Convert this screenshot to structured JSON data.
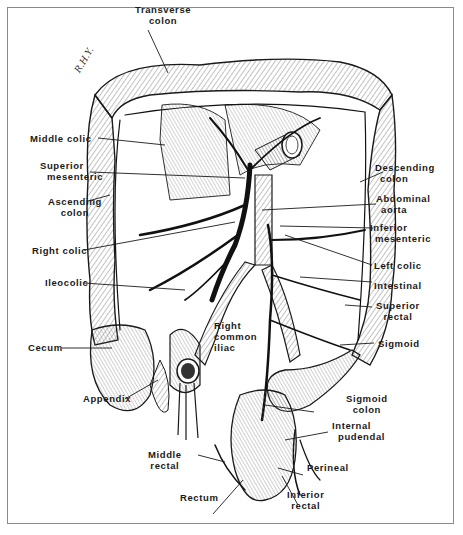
{
  "figure": {
    "signature": "R.H.Y."
  },
  "labels": {
    "transverse_colon": [
      "Transverse",
      "colon"
    ],
    "middle_colic": [
      "Middle colic"
    ],
    "superior_mesenteric": [
      "Superior",
      "mesenteric"
    ],
    "ascending_colon": [
      "Ascending",
      "colon"
    ],
    "right_colic": [
      "Right colic"
    ],
    "ileocolic": [
      "Ileocolic"
    ],
    "cecum": [
      "Cecum"
    ],
    "appendix": [
      "Appendix"
    ],
    "right_common_iliac": [
      "Right",
      "common",
      "iliac"
    ],
    "middle_rectal": [
      "Middle",
      "rectal"
    ],
    "rectum": [
      "Rectum"
    ],
    "inferior_rectal": [
      "Inferior",
      "rectal"
    ],
    "perineal": [
      "Perineal"
    ],
    "internal_pudendal": [
      "Internal",
      "pudendal"
    ],
    "sigmoid_colon": [
      "Sigmoid",
      "colon"
    ],
    "sigmoid": [
      "Sigmoid"
    ],
    "superior_rectal": [
      "Superior",
      "rectal"
    ],
    "intestinal": [
      "Intestinal"
    ],
    "left_colic": [
      "Left colic"
    ],
    "inferior_mesenteric": [
      "Inferior",
      "mesenteric"
    ],
    "abdominal_aorta": [
      "Abdominal",
      "aorta"
    ],
    "descending_colon": [
      "Descending",
      "colon"
    ]
  },
  "colors": {
    "ink": "#1a1a1a",
    "hatch": "#555555",
    "frame": "#8a8a8a",
    "background": "#ffffff"
  }
}
